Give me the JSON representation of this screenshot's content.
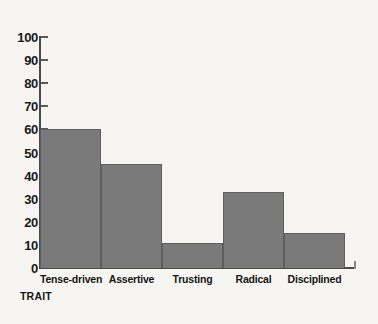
{
  "chart_data": {
    "type": "bar",
    "title": "",
    "xlabel": "TRAIT",
    "ylabel": "",
    "categories": [
      "Tense-driven",
      "Assertive",
      "Trusting",
      "Radical",
      "Disciplined"
    ],
    "values": [
      60,
      45,
      11,
      33,
      15
    ],
    "ylim": [
      0,
      100
    ],
    "ytick_labels": [
      "100",
      "90",
      "80",
      "70",
      "60",
      "50",
      "40",
      "30",
      "20",
      "10",
      "0"
    ],
    "ytick_values": [
      100,
      90,
      80,
      70,
      60,
      50,
      40,
      30,
      20,
      10,
      0
    ],
    "ytick_step": 10,
    "grid": false,
    "legend": "none",
    "bar_color": "#7a7a7a",
    "bar_edge_color": "#5e5e5e",
    "axis_color": "#4a4a4a",
    "background_color": "#f6f5f2",
    "text_color": "#161616"
  }
}
